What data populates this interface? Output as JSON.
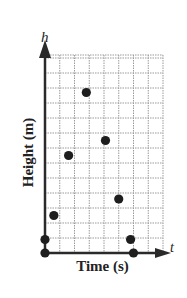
{
  "chart_data": {
    "type": "scatter",
    "title": "",
    "xlabel": "Time (s)",
    "ylabel": "Height (m)",
    "x_axis_variable": "t",
    "y_axis_variable": "h",
    "grid": true,
    "grid_columns": 8,
    "grid_rows": 13,
    "xlim": [
      0,
      8
    ],
    "ylim": [
      0,
      13.2
    ],
    "tick_labels": "none",
    "legend": null,
    "points": [
      {
        "x": 0,
        "y": 0
      },
      {
        "x": 0,
        "y": 0.9
      },
      {
        "x": 0.6,
        "y": 2.5
      },
      {
        "x": 1.6,
        "y": 6.5
      },
      {
        "x": 2.8,
        "y": 10.7
      },
      {
        "x": 4.1,
        "y": 7.5
      },
      {
        "x": 5.0,
        "y": 3.6
      },
      {
        "x": 5.8,
        "y": 0.9
      },
      {
        "x": 6.0,
        "y": 0
      }
    ]
  },
  "labels": {
    "x_axis": "Time (s)",
    "y_axis": "Height (m)",
    "x_var": "t",
    "y_var": "h"
  },
  "colors": {
    "axis": "#2a2a2a",
    "grid": "#9a9a9a",
    "point": "#1e1e1e",
    "text": "#222222"
  }
}
